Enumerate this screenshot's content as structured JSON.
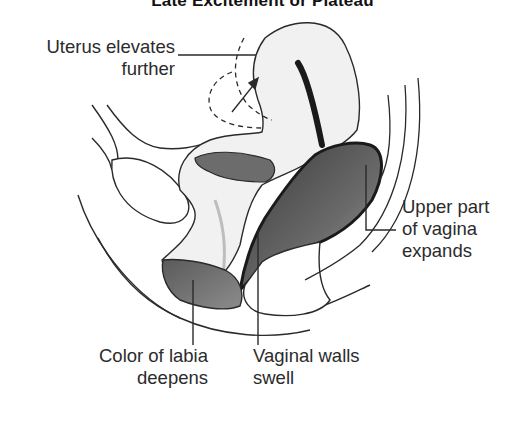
{
  "title": "Late Excitement or Plateau",
  "labels": {
    "uterus": {
      "line1": "Uterus elevates",
      "line2": "further"
    },
    "upper_vagina": {
      "line1": "Upper part",
      "line2": "of vagina",
      "line3": "expands"
    },
    "labia": {
      "line1": "Color of labia",
      "line2": "deepens"
    },
    "vaginal_walls": {
      "line1": "Vaginal walls",
      "line2": "swell"
    }
  },
  "colors": {
    "outline": "#2a2a2a",
    "tissue_light": "#f1f1f1",
    "tissue_mid": "#8a8a8a",
    "tissue_dark": "#4a4a4a",
    "background": "#ffffff"
  }
}
